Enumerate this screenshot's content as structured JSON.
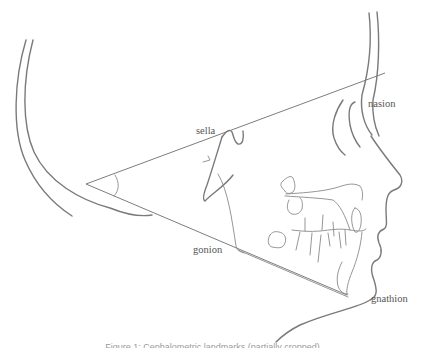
{
  "figure": {
    "type": "cephalometric line drawing",
    "angle_vertex_label": "",
    "labels": {
      "sella": "sella",
      "nasion": "nasion",
      "gonion": "gonion",
      "gnathion": "gnathion"
    },
    "caption": "Figure 1: Cephalometric landmarks (partially cropped)",
    "colors": {
      "line": "#7a7a7a",
      "text": "#555555",
      "background": "#ffffff"
    }
  }
}
